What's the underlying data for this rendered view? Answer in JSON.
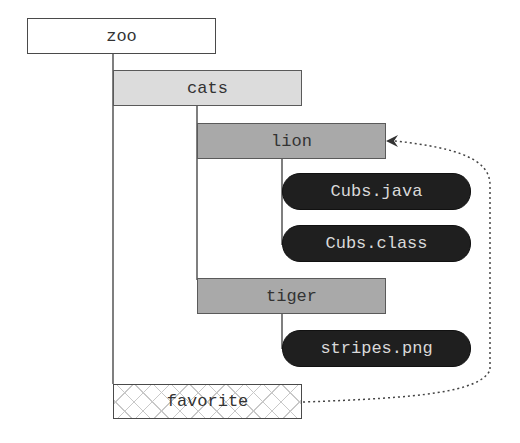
{
  "diagram": {
    "nodes": {
      "zoo": {
        "label": "zoo",
        "type": "directory"
      },
      "cats": {
        "label": "cats",
        "type": "directory"
      },
      "lion": {
        "label": "lion",
        "type": "directory"
      },
      "cubs_java": {
        "label": "Cubs.java",
        "type": "file"
      },
      "cubs_class": {
        "label": "Cubs.class",
        "type": "file"
      },
      "tiger": {
        "label": "tiger",
        "type": "directory"
      },
      "stripes": {
        "label": "stripes.png",
        "type": "file"
      },
      "favorite": {
        "label": "favorite",
        "type": "symbolic-link"
      }
    },
    "edges": [
      {
        "from": "zoo",
        "to": "cats"
      },
      {
        "from": "zoo",
        "to": "favorite"
      },
      {
        "from": "cats",
        "to": "lion"
      },
      {
        "from": "cats",
        "to": "tiger"
      },
      {
        "from": "lion",
        "to": "Cubs.java"
      },
      {
        "from": "lion",
        "to": "Cubs.class"
      },
      {
        "from": "tiger",
        "to": "stripes.png"
      },
      {
        "from": "favorite",
        "to": "lion",
        "style": "dotted-arrow"
      }
    ],
    "colors": {
      "root_fill": "#ffffff",
      "level1_fill": "#dcdcdc",
      "level2_fill": "#a9a9a9",
      "file_fill": "#1f1f1f",
      "file_text": "#d9d9d9",
      "line": "#555555"
    }
  }
}
